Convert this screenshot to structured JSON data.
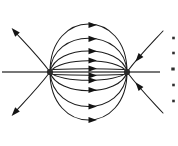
{
  "figure": {
    "width": 178,
    "height": 146,
    "background_color": "#ffffff",
    "line_color": "#1b1b1b",
    "axis_color": "#4a4a4a",
    "arrow_color": "#141414",
    "pole_color": "#2a2a2a"
  },
  "chart_data": {
    "type": "line",
    "xlabel": "",
    "ylabel": "",
    "xlim": [
      0,
      178
    ],
    "ylim": [
      0,
      146
    ],
    "grid": false,
    "legend_position": "none",
    "poles": [
      {
        "name": "source-pole-left",
        "polarity": "positive",
        "x": 50,
        "y": 72,
        "radius": 3.1
      },
      {
        "name": "sink-pole-right",
        "polarity": "negative",
        "x": 127,
        "y": 72,
        "radius": 3.1
      }
    ],
    "axis": {
      "name": "horizontal-axis",
      "x1": 2,
      "y1": 72,
      "x2": 160,
      "y2": 72
    },
    "series": [
      {
        "name": "arc-upper-outer",
        "path": "M 50 72 C 50 8 127 8 127 72",
        "arrows": [
          {
            "x": 88.5,
            "y": 25.0,
            "angle": 0
          }
        ]
      },
      {
        "name": "arc-upper-mid",
        "path": "M 50 72 C 52 27 125 27 127 72",
        "arrows": [
          {
            "x": 88.5,
            "y": 38.8,
            "angle": 0
          }
        ]
      },
      {
        "name": "arc-upper-inner",
        "path": "M 50 72 C 56 44 121 44 127 72",
        "arrows": [
          {
            "x": 88.5,
            "y": 51.2,
            "angle": 0
          }
        ]
      },
      {
        "name": "arc-upper-near",
        "path": "M 50 72 C 60 57 117 57 127 72",
        "arrows": [
          {
            "x": 88.5,
            "y": 60.5,
            "angle": 0
          }
        ]
      },
      {
        "name": "line-axis-center",
        "path": "M 53 69.5 C 75 68.6 104 68.6 124 69.5",
        "arrows": [
          {
            "x": 88.5,
            "y": 68.6,
            "angle": 0
          }
        ]
      },
      {
        "name": "line-axis-center-lower",
        "path": "M 53 74.5 C 75 75.4 104 75.4 124 74.5",
        "arrows": [
          {
            "x": 88.5,
            "y": 75.4,
            "angle": 0
          }
        ]
      },
      {
        "name": "arc-lower-near",
        "path": "M 50 72 C 59 83 118 83 127 72",
        "arrows": [
          {
            "x": 88.5,
            "y": 80.3,
            "angle": 0
          }
        ]
      },
      {
        "name": "arc-lower-inner",
        "path": "M 50 72 C 57 97 120 97 127 72",
        "arrows": [
          {
            "x": 88.5,
            "y": 90.0,
            "angle": 0
          }
        ]
      },
      {
        "name": "arc-lower-mid",
        "path": "M 50 72 C 53 118 124 118 127 72",
        "arrows": [
          {
            "x": 88.5,
            "y": 106.5,
            "angle": 0
          }
        ]
      },
      {
        "name": "arc-lower-outer",
        "path": "M 50 72 C 50 136 127 136 127 72",
        "arrows": [
          {
            "x": 88.5,
            "y": 120.0,
            "angle": 0
          }
        ]
      },
      {
        "name": "escape-upper-left",
        "path": "M 50 72 C 38 56 26 44 14 31",
        "arrows": [
          {
            "x": 17.5,
            "y": 34.6,
            "angle": 228
          }
        ]
      },
      {
        "name": "escape-lower-left",
        "path": "M 50 72 C 38 88 26 100 14 113",
        "arrows": [
          {
            "x": 17.5,
            "y": 109.4,
            "angle": 132
          }
        ]
      },
      {
        "name": "enter-upper-right",
        "path": "M 163 31 C 151 44 139 56 127 72",
        "arrows": [
          {
            "x": 141.0,
            "y": 55.0,
            "angle": 129
          }
        ]
      },
      {
        "name": "enter-lower-right",
        "path": "M 163 113 C 151 100 139 88 127 72",
        "arrows": [
          {
            "x": 141.0,
            "y": 89.0,
            "angle": 231
          }
        ]
      }
    ],
    "edge_marks": [
      {
        "name": "edge-mark-1",
        "x": 173.5,
        "y": 38
      },
      {
        "name": "edge-mark-2",
        "x": 173.5,
        "y": 53
      },
      {
        "name": "edge-mark-3",
        "x": 173.0,
        "y": 69
      },
      {
        "name": "edge-mark-4",
        "x": 173.5,
        "y": 85
      },
      {
        "name": "edge-mark-5",
        "x": 173.5,
        "y": 101
      }
    ]
  }
}
